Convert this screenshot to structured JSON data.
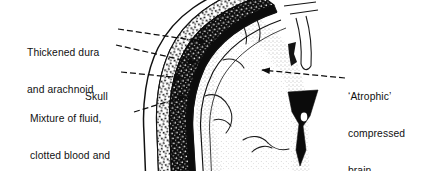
{
  "figure": {
    "background_color": "#ffffff",
    "ink_color": "#111111",
    "width": 433,
    "height": 171
  },
  "labels": {
    "thickened_dura": {
      "name": "thickened-dura-and-arachnoid",
      "lines": [
        "Thickened dura",
        "and arachnoid"
      ],
      "line1": "Thickened dura",
      "line2": "and arachnoid"
    },
    "skull": {
      "name": "skull",
      "lines": [
        "Skull"
      ],
      "line1": "Skull"
    },
    "mixture": {
      "name": "mixture-of-fluid-clotted-blood",
      "lines": [
        "Mixture of fluid,",
        "clotted blood and",
        "blood degradation",
        "products"
      ],
      "line1": "Mixture of fluid,",
      "line2": "clotted blood and",
      "line3": "blood degradation",
      "line4": "products"
    },
    "atrophic_brain": {
      "name": "atrophic-compressed-brain",
      "lines": [
        "‘Atrophic’",
        "compressed",
        "brain"
      ],
      "line1": "‘Atrophic’",
      "line2": "compressed",
      "line3": "brain"
    }
  },
  "anatomy": {
    "structures": [
      "skull vault with diploe",
      "thickened dura and arachnoid membrane",
      "subdural collection of fluid, clotted blood and blood degradation products",
      "compressed atrophic cerebral hemisphere",
      "lateral ventricle",
      "choroid plexus",
      "cortical sulci",
      "falx cerebri"
    ]
  },
  "leaders": {
    "count": 4,
    "style": "dashed-with-solid-arrowhead",
    "dash_pattern": "6 3"
  }
}
